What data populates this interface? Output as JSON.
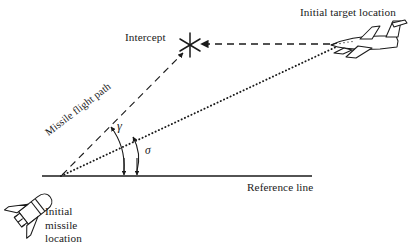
{
  "figure": {
    "kind": "missile-intercept-geometry-diagram",
    "background_color": "#ffffff",
    "line_color": "#1a1a1a"
  },
  "labels": {
    "initial_target_location": "Initial target location",
    "intercept": "Intercept",
    "reference_line": "Reference line",
    "missile_flight_path": "Missile flight path",
    "gamma": "γ",
    "sigma": "σ",
    "initial_missile_location_line1": "Initial",
    "initial_missile_location_line2": "missile",
    "initial_missile_location_line3": "location"
  },
  "geometry": {
    "origin_missile": {
      "x": 60,
      "y": 176
    },
    "intercept_point": {
      "x": 190,
      "y": 45
    },
    "target_point": {
      "x": 333,
      "y": 48
    },
    "reference_line": {
      "x1": 42,
      "y1": 176,
      "x2": 312,
      "y2": 176
    },
    "missile_flight_path": {
      "x1": 60,
      "y1": 176,
      "x2": 184,
      "y2": 51
    },
    "line_of_sight_dotted": {
      "x1": 60,
      "y1": 176,
      "x2": 336,
      "y2": 47
    },
    "target_velocity_arrow": {
      "x1": 331,
      "y1": 44,
      "x2": 199,
      "y2": 44
    },
    "gamma_arc": {
      "base_x": 124,
      "base_y": 176,
      "top_x": 110,
      "top_y": 124
    },
    "sigma_arc": {
      "base_x": 137,
      "base_y": 176,
      "top_x": 133,
      "top_y": 134
    }
  },
  "icons": {
    "intercept_marker": "asterisk-star-icon",
    "target": "jet-aircraft-icon",
    "missile": "missile-icon"
  }
}
